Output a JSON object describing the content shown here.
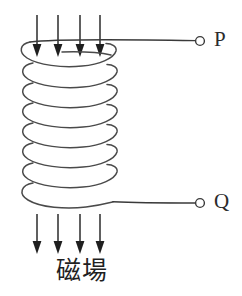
{
  "figure": {
    "type": "physics-diagram",
    "background_color": "#ffffff",
    "line_color": "#3a3a3a"
  },
  "terminals": [
    {
      "id": "P",
      "label": "P",
      "marker": "open-circle",
      "x": 198,
      "y": 41
    },
    {
      "id": "Q",
      "label": "Q",
      "marker": "open-circle",
      "x": 198,
      "y": 203
    }
  ],
  "coil": {
    "turns": 8,
    "left": 19,
    "right": 116,
    "top": 40,
    "bottom": 206,
    "turn_spacing": 20,
    "ellipse_ry": 11,
    "description": "helical solenoid coil drawn as eight stacked loops"
  },
  "leads": [
    {
      "name": "top-lead",
      "from_x": 30,
      "from_y": 41,
      "to_x": 196,
      "to_y": 41,
      "terminal": "P"
    },
    {
      "name": "bottom-lead",
      "from_x": 113,
      "from_y": 203,
      "to_x": 196,
      "to_y": 203,
      "terminal": "Q"
    }
  ],
  "field_arrows": {
    "direction": "down",
    "color": "#1f1f1f",
    "top_group": {
      "count": 4,
      "x_positions": [
        37,
        58,
        80,
        100
      ],
      "y_start": 15,
      "y_end": 57
    },
    "bottom_group": {
      "count": 4,
      "x_positions": [
        37,
        58,
        80,
        100
      ],
      "y_start": 214,
      "y_end": 254
    }
  },
  "labels": {
    "field": "磁場",
    "terminal_p": "P",
    "terminal_q": "Q"
  }
}
